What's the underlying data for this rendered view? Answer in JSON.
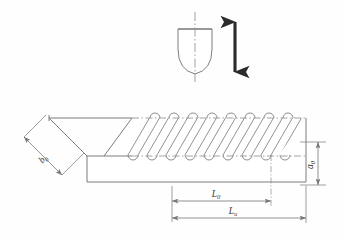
{
  "figure": {
    "line_color": "#6e6e6e",
    "dim_color": "#777777",
    "arrow_color": "#2b2b2b",
    "center_line_color": "#8a8a8a",
    "background": "#ffffff"
  },
  "tool": {
    "name": "indenter-tool",
    "shape": "rounded-tip punch",
    "centerline": "dash-dot vertical axis"
  },
  "motion": {
    "name": "oscillation-arrow",
    "type": "double-headed vertical arrow",
    "meaning": "reciprocating tool motion"
  },
  "workpiece": {
    "name": "rectangular-bar-specimen",
    "treated_zone": "diagonal burnished grooves"
  },
  "labels": {
    "width": {
      "symbol": "b",
      "subscript": "0"
    },
    "depth": {
      "symbol": "a",
      "subscript": "0"
    },
    "length_short": {
      "symbol": "L",
      "subscript": "0"
    },
    "length_long": {
      "symbol": "L",
      "subscript": "u"
    }
  },
  "dimensions": [
    {
      "name": "b0",
      "symbol": "b",
      "subscript": "0",
      "orientation": "diagonal-left"
    },
    {
      "name": "a0",
      "symbol": "a",
      "subscript": "0",
      "orientation": "vertical-right"
    },
    {
      "name": "L0",
      "symbol": "L",
      "subscript": "0",
      "orientation": "horizontal-upper"
    },
    {
      "name": "Lu",
      "symbol": "L",
      "subscript": "u",
      "orientation": "horizontal-lower"
    }
  ]
}
